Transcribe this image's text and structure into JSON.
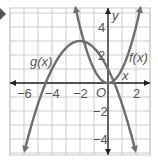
{
  "chart_data": {
    "type": "line",
    "title": "",
    "xlabel": "x",
    "ylabel": "y",
    "origin_label": "O",
    "xlim": [
      -7,
      3
    ],
    "ylim": [
      -5,
      5.3
    ],
    "x_ticks": [
      -6,
      -4,
      -2,
      2
    ],
    "x_tick_labels": [
      "−6",
      "−4",
      "−2",
      "2"
    ],
    "y_ticks": [
      4,
      2,
      -2,
      -4
    ],
    "y_tick_labels": [
      "4",
      "2",
      "−2",
      "−4"
    ],
    "grid": true,
    "series": [
      {
        "name": "f(x)",
        "label": "f(x)",
        "equation": "x^2",
        "vertex": [
          0,
          0
        ],
        "color": "#6e6e6e"
      },
      {
        "name": "g(x)",
        "label": "g(x)",
        "equation": "-0.5(x+2)^2+3",
        "vertex": [
          -2,
          3
        ],
        "x_intercepts": [
          -4.45,
          0.45
        ],
        "color": "#6e6e6e"
      }
    ]
  },
  "colors": {
    "axis": "#222222",
    "grid": "#cccccc",
    "curve": "#6e6e6e",
    "marker": "#555555"
  }
}
